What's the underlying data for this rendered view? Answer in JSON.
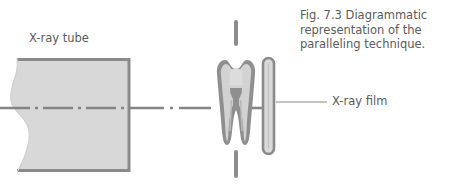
{
  "figure": {
    "caption_lines": [
      "Fig. 7.3 Diagrammatic",
      "representation of the",
      "paralleling technique."
    ],
    "caption_full": "Fig. 7.3 Diagrammatic representation of the paralleling technique."
  },
  "labels": {
    "xray_tube": "X-ray tube",
    "xray_film": "X-ray film"
  },
  "colors": {
    "background": "#ffffff",
    "text": "#5b5b5b",
    "outline": "#8a8a8a",
    "outline_dark": "#7c7c7c",
    "fill_light": "#d5d5d5",
    "fill_lighter": "#dedede",
    "fill_tooth_inner": "#d2d2d2",
    "leader_line": "#8a8a8a",
    "centerline": "#7e7e7e"
  },
  "diagram": {
    "type": "dental-radiography-paralleling-technique",
    "elements": [
      {
        "name": "x-ray-tube",
        "description": "Cone-shaped x-ray tube head with wavy broken left edge and straight right edge",
        "x": 8,
        "y": 58,
        "width": 124,
        "height": 114
      },
      {
        "name": "central-beam",
        "description": "Horizontal dash-dot center ray from tube through tooth to film",
        "y": 108,
        "x_start": 0,
        "x_end": 272,
        "pattern": "dash-dot"
      },
      {
        "name": "tooth",
        "description": "Molar tooth in cross-section with crown, pulp chamber and two roots",
        "x": 214,
        "y": 58,
        "width": 42,
        "height": 86
      },
      {
        "name": "long-axis-line",
        "description": "Vertical dashed long-axis line through the tooth",
        "x": 236,
        "y_start": 22,
        "y_end": 180,
        "pattern": "dashed"
      },
      {
        "name": "x-ray-film",
        "description": "Vertical rounded rectangle film packet parallel to tooth long axis",
        "x": 262,
        "y": 57,
        "width": 13,
        "height": 98
      },
      {
        "name": "film-leader-line",
        "description": "Thin horizontal leader line connecting film to its label",
        "y": 102,
        "x_start": 276,
        "x_end": 327
      }
    ]
  }
}
